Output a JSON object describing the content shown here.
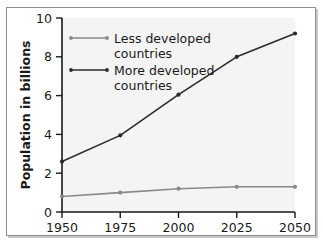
{
  "chart_data": {
    "type": "line",
    "title": "",
    "xlabel": "",
    "ylabel": "Population in billions",
    "x": [
      1950,
      1975,
      2000,
      2025,
      2050
    ],
    "xtick_labels": [
      "1950",
      "1975",
      "2000",
      "2025",
      "2050"
    ],
    "ytick_labels": [
      "0",
      "2",
      "4",
      "6",
      "8",
      "10"
    ],
    "yticks": [
      0,
      2,
      4,
      6,
      8,
      10
    ],
    "ylim": [
      0,
      10
    ],
    "xlim": [
      1950,
      2050
    ],
    "grid": false,
    "legend_position": "upper-left-inside",
    "series": [
      {
        "name": "Less developed countries",
        "values": [
          0.8,
          1.0,
          1.2,
          1.3,
          1.3
        ],
        "color": "#8a8a8a",
        "marker": "circle"
      },
      {
        "name": "More developed countries",
        "values": [
          2.6,
          3.95,
          6.05,
          8.0,
          9.2
        ],
        "color": "#2b2b2b",
        "marker": "circle"
      }
    ]
  },
  "axes": {
    "y_title": "Population in billions",
    "y_ticks": [
      {
        "label": "10",
        "value": 10
      },
      {
        "label": "8",
        "value": 8
      },
      {
        "label": "6",
        "value": 6
      },
      {
        "label": "4",
        "value": 4
      },
      {
        "label": "2",
        "value": 2
      },
      {
        "label": "0",
        "value": 0
      }
    ],
    "x_ticks": [
      {
        "label": "1950",
        "value": 1950
      },
      {
        "label": "1975",
        "value": 1975
      },
      {
        "label": "2000",
        "value": 2000
      },
      {
        "label": "2025",
        "value": 2025
      },
      {
        "label": "2050",
        "value": 2050
      }
    ]
  },
  "legend": {
    "entries": [
      {
        "label_line1": "Less developed",
        "label_line2": "countries",
        "color": "#8a8a8a"
      },
      {
        "label_line1": "More developed",
        "label_line2": "countries",
        "color": "#2b2b2b"
      }
    ]
  },
  "colors": {
    "less_developed": "#8a8a8a",
    "more_developed": "#2b2b2b",
    "axis": "#1a1a1a",
    "plot_background": "#f4f4f4",
    "page_background": "#ffffff",
    "frame_border": "#8d8d8d"
  }
}
